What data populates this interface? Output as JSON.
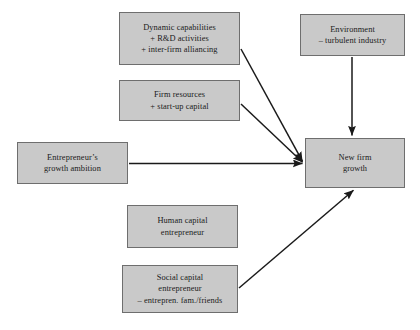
{
  "diagram": {
    "type": "flow-diagram",
    "style": {
      "node_fill": "#c9c9c9",
      "node_border": "#6e6e6e",
      "arrow_color": "#1a1a1a",
      "background": "#ffffff",
      "text_color": "#1a1a1a"
    },
    "nodes": [
      {
        "id": "dynamic-capabilities",
        "lines": [
          "Dynamic capabilities",
          "+ R&D activities",
          "+ inter-firm alliancing"
        ]
      },
      {
        "id": "environment",
        "lines": [
          "Environment",
          "– turbulent industry"
        ]
      },
      {
        "id": "firm-resources",
        "lines": [
          "Firm resources",
          "+ start-up capital"
        ]
      },
      {
        "id": "entrepreneur-ambition",
        "lines": [
          "Entrepreneur’s",
          "growth ambition"
        ]
      },
      {
        "id": "human-capital",
        "lines": [
          "Human capital",
          "entrepreneur"
        ]
      },
      {
        "id": "social-capital",
        "lines": [
          "Social capital",
          "entrepreneur",
          "– entrepren. fam./friends"
        ]
      },
      {
        "id": "new-firm-growth",
        "lines": [
          "New firm",
          "growth"
        ]
      }
    ],
    "edges": [
      {
        "id": "dynamic-capabilities-to-growth",
        "from": "dynamic-capabilities",
        "to": "new-firm-growth"
      },
      {
        "id": "firm-resources-to-growth",
        "from": "firm-resources",
        "to": "new-firm-growth"
      },
      {
        "id": "entrepreneur-ambition-to-growth",
        "from": "entrepreneur-ambition",
        "to": "new-firm-growth"
      },
      {
        "id": "environment-to-growth",
        "from": "environment",
        "to": "new-firm-growth"
      },
      {
        "id": "social-capital-to-growth",
        "from": "social-capital",
        "to": "new-firm-growth"
      }
    ]
  }
}
